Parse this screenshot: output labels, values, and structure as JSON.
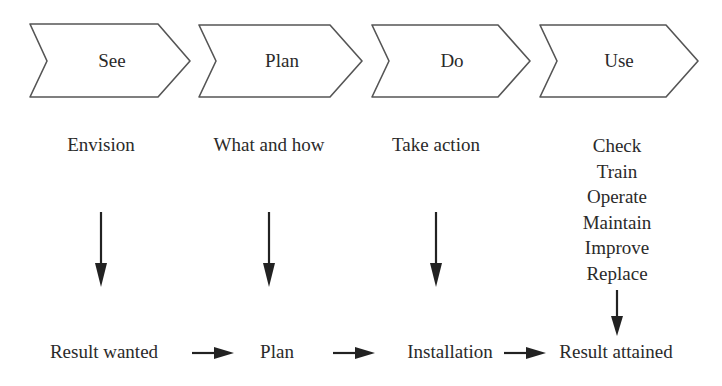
{
  "stages": [
    {
      "label": "See",
      "description": "Envision",
      "result": "Result wanted"
    },
    {
      "label": "Plan",
      "description": "What and how",
      "result": "Plan"
    },
    {
      "label": "Do",
      "description": "Take action",
      "result": "Installation"
    },
    {
      "label": "Use",
      "description_items": [
        "Check",
        "Train",
        "Operate",
        "Maintain",
        "Improve",
        "Replace"
      ],
      "result": "Result attained"
    }
  ],
  "colors": {
    "stroke": "#555555",
    "text": "#2a2a2a",
    "arrow": "#222222"
  }
}
